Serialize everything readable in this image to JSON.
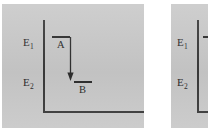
{
  "figure": {
    "background_color": "#ffffff",
    "panel_color": "#c9c9c9",
    "ink_color": "#2e2e2e",
    "panels": [
      {
        "id": "left",
        "name": "energy-level-diagram-left",
        "axes": {
          "vertical_name": "energy-axis",
          "horizontal_name": "baseline-axis"
        },
        "regions": [
          {
            "label": "E",
            "subscript": "1",
            "name": "energy-region-e1"
          },
          {
            "label": "E",
            "subscript": "2",
            "name": "energy-region-e2"
          }
        ],
        "levels": [
          {
            "label": "A",
            "name": "level-a"
          },
          {
            "label": "B",
            "name": "level-b"
          }
        ],
        "arrow": {
          "name": "downward-transition-arrow",
          "direction": "down",
          "from_level": "A",
          "to_level": "B"
        }
      },
      {
        "id": "right",
        "name": "energy-level-diagram-right",
        "cropped": true,
        "regions": [
          {
            "label": "E",
            "subscript": "1",
            "name": "energy-region-e1"
          },
          {
            "label": "E",
            "subscript": "2",
            "name": "energy-region-e2"
          }
        ],
        "levels": [
          {
            "label": "A",
            "name": "level-a"
          }
        ]
      }
    ]
  }
}
